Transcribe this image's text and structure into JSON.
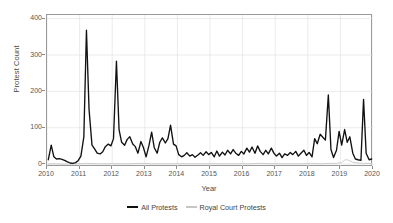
{
  "chart_data": {
    "type": "line",
    "title": "",
    "xlabel": "Year",
    "ylabel": "Protest Count",
    "xlim": [
      2010.0,
      2020.0
    ],
    "ylim": [
      -8,
      410
    ],
    "grid": true,
    "legend_position": "bottom",
    "xticks": [
      2010,
      2011,
      2012,
      2013,
      2014,
      2015,
      2016,
      2017,
      2018,
      2019,
      2020
    ],
    "xticklabels": [
      "2010",
      "2011",
      "2012",
      "2013",
      "2014",
      "2015",
      "2016",
      "2017",
      "2018",
      "2019",
      "2020"
    ],
    "yticks": [
      0,
      100,
      200,
      300,
      400
    ],
    "yticklabels": [
      "0",
      "100",
      "200",
      "300",
      "400"
    ],
    "series": [
      {
        "name": "All Protests",
        "color": "#111111",
        "width": 1.35,
        "x": [
          2010.04,
          2010.13,
          2010.21,
          2010.29,
          2010.38,
          2010.46,
          2010.54,
          2010.63,
          2010.71,
          2010.79,
          2010.88,
          2010.96,
          2011.04,
          2011.13,
          2011.21,
          2011.29,
          2011.38,
          2011.46,
          2011.54,
          2011.63,
          2011.71,
          2011.79,
          2011.88,
          2011.96,
          2012.04,
          2012.13,
          2012.21,
          2012.29,
          2012.38,
          2012.46,
          2012.54,
          2012.63,
          2012.71,
          2012.79,
          2012.88,
          2012.96,
          2013.04,
          2013.13,
          2013.21,
          2013.29,
          2013.38,
          2013.46,
          2013.54,
          2013.63,
          2013.71,
          2013.79,
          2013.88,
          2013.96,
          2014.04,
          2014.13,
          2014.21,
          2014.29,
          2014.38,
          2014.46,
          2014.54,
          2014.63,
          2014.71,
          2014.79,
          2014.88,
          2014.96,
          2015.04,
          2015.13,
          2015.21,
          2015.29,
          2015.38,
          2015.46,
          2015.54,
          2015.63,
          2015.71,
          2015.79,
          2015.88,
          2015.96,
          2016.04,
          2016.13,
          2016.21,
          2016.29,
          2016.38,
          2016.46,
          2016.54,
          2016.63,
          2016.71,
          2016.79,
          2016.88,
          2016.96,
          2017.04,
          2017.13,
          2017.21,
          2017.29,
          2017.38,
          2017.46,
          2017.54,
          2017.63,
          2017.71,
          2017.79,
          2017.88,
          2017.96,
          2018.04,
          2018.13,
          2018.21,
          2018.29,
          2018.38,
          2018.46,
          2018.54,
          2018.63,
          2018.71,
          2018.79,
          2018.88,
          2018.96,
          2019.04,
          2019.13,
          2019.21,
          2019.29,
          2019.38,
          2019.46,
          2019.54,
          2019.63,
          2019.71,
          2019.79,
          2019.88,
          2019.96
        ],
        "values": [
          12,
          52,
          20,
          14,
          15,
          13,
          10,
          6,
          3,
          2,
          4,
          10,
          22,
          75,
          368,
          150,
          52,
          42,
          30,
          28,
          34,
          48,
          55,
          50,
          70,
          283,
          95,
          60,
          52,
          68,
          75,
          55,
          48,
          30,
          62,
          45,
          20,
          52,
          88,
          45,
          30,
          60,
          72,
          58,
          70,
          107,
          55,
          50,
          26,
          20,
          24,
          31,
          22,
          26,
          19,
          25,
          31,
          24,
          34,
          26,
          32,
          20,
          36,
          22,
          33,
          25,
          38,
          28,
          40,
          30,
          24,
          35,
          28,
          44,
          33,
          47,
          30,
          50,
          35,
          26,
          38,
          28,
          44,
          30,
          22,
          30,
          18,
          28,
          24,
          32,
          26,
          35,
          22,
          30,
          38,
          24,
          32,
          20,
          70,
          56,
          82,
          74,
          66,
          190,
          40,
          18,
          38,
          90,
          52,
          95,
          60,
          75,
          30,
          14,
          12,
          10,
          178,
          30,
          12,
          14
        ]
      },
      {
        "name": "Royal Court Protests",
        "color": "#c6c6c6",
        "width": 0.9,
        "x": [
          2010.04,
          2010.21,
          2010.46,
          2010.79,
          2011.04,
          2011.21,
          2011.54,
          2011.88,
          2012.21,
          2012.54,
          2012.88,
          2013.21,
          2013.54,
          2013.88,
          2014.21,
          2014.54,
          2014.88,
          2015.21,
          2015.54,
          2015.88,
          2016.21,
          2016.54,
          2016.88,
          2017.21,
          2017.54,
          2017.88,
          2018.13,
          2018.38,
          2018.63,
          2018.88,
          2019.04,
          2019.13,
          2019.21,
          2019.29,
          2019.38,
          2019.54,
          2019.71,
          2019.88,
          2019.96
        ],
        "values": [
          0,
          1,
          0,
          0,
          1,
          2,
          1,
          1,
          1,
          1,
          2,
          1,
          1,
          1,
          1,
          1,
          1,
          1,
          1,
          1,
          1,
          2,
          1,
          1,
          1,
          1,
          2,
          1,
          2,
          2,
          4,
          11,
          12,
          9,
          5,
          3,
          2,
          2,
          1
        ]
      }
    ]
  },
  "legend": {
    "items": [
      {
        "label": "All Protests",
        "color": "#111111"
      },
      {
        "label": "Royal Court Protests",
        "color": "#c6c6c6"
      }
    ]
  }
}
